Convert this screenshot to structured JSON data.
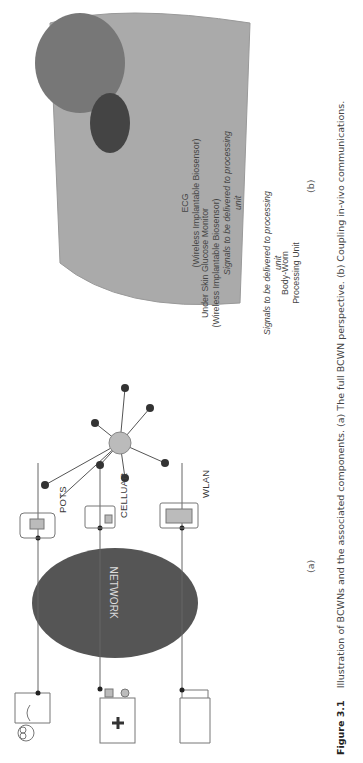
{
  "figure": {
    "number": "Figure 3.1",
    "caption": "Illustration of BCWNs and the associated components. (a) The full BCWN perspective. (b) Coupling in-vivo communications.",
    "panel_a_label": "(a)",
    "panel_b_label": "(b)"
  },
  "panel_a": {
    "network_label": "NETWORK",
    "gateways": [
      "POTS",
      "CELLUAR",
      "WLAN"
    ],
    "sensors": [
      "EEG",
      "VISION",
      "HEATING",
      "ECG",
      "POSITIONING",
      "GLUCOSE",
      "BLOOD PRESSURE",
      "TOXINS",
      "DNA",
      "PROTEIN",
      "IMPLANTS"
    ],
    "endpoints": [
      "physician",
      "hospital",
      "records"
    ]
  },
  "panel_b": {
    "ecg_title": "ECG",
    "ecg_sub": "(Wireless Implantable Biosensor)",
    "ecg_signal_note_1": "Signals to be delivered to processing",
    "ecg_signal_note_2": "unit",
    "glucose_title": "Under Skin Glucose Monitor",
    "glucose_sub": "(Wireless Implantable Biosensor)",
    "glucose_signal_note_1": "Signals to be delivered to processing",
    "glucose_signal_note_2": "unit",
    "bwpu_1": "Body-Worn",
    "bwpu_2": "Processing Unit"
  }
}
